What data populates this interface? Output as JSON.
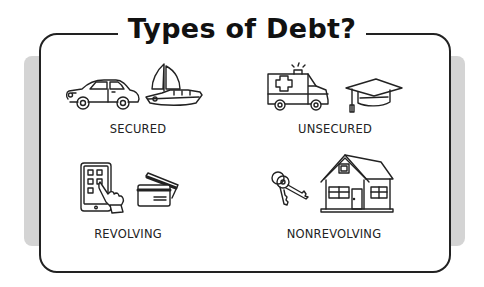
{
  "title": "Types of Debt?",
  "categories": [
    {
      "id": "secured",
      "label": "SECURED",
      "icons": [
        "car-icon",
        "sailboat-icon"
      ]
    },
    {
      "id": "unsecured",
      "label": "UNSECURED",
      "icons": [
        "ambulance-icon",
        "graduation-cap-icon"
      ]
    },
    {
      "id": "revolving",
      "label": "REVOLVING",
      "icons": [
        "tablet-touch-icon",
        "credit-cards-icon"
      ]
    },
    {
      "id": "nonrevolving",
      "label": "NONREVOLVING",
      "icons": [
        "keys-icon",
        "house-icon"
      ]
    }
  ],
  "colors": {
    "stroke": "#222222",
    "shadow": "#d4d4d4",
    "background": "#ffffff"
  }
}
